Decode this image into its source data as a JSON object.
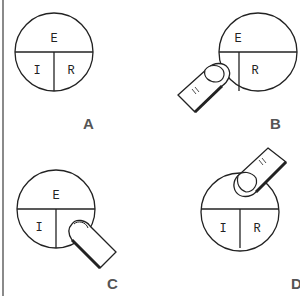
{
  "panels": [
    {
      "id": "A",
      "label": "A",
      "segments": {
        "top": "E",
        "left": "I",
        "right": "R"
      },
      "touch": "none"
    },
    {
      "id": "B",
      "label": "B",
      "segments": {
        "top": "E",
        "left": "I",
        "right": "R"
      },
      "touch": "left"
    },
    {
      "id": "C",
      "label": "C",
      "segments": {
        "top": "E",
        "left": "I",
        "right": "R"
      },
      "touch": "right"
    },
    {
      "id": "D",
      "label": "D",
      "segments": {
        "top": "E",
        "left": "I",
        "right": "R"
      },
      "touch": "top"
    }
  ],
  "colors": {
    "line": "#222222",
    "label": "#555555",
    "border": "#8a8a8a"
  }
}
